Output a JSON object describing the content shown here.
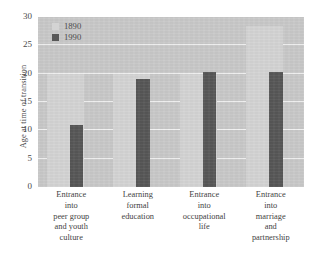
{
  "chart_data": {
    "type": "bar",
    "title": "",
    "subtitle": "",
    "xlabel": "",
    "ylabel": "Age at time of transition",
    "ylim": [
      0,
      30
    ],
    "ytick_values": [
      30,
      25,
      20,
      15,
      10,
      5,
      0
    ],
    "ytick_labels": [
      "30",
      "25",
      "20",
      "15",
      "10",
      "5",
      "0"
    ],
    "grid": true,
    "grid_axis": "y",
    "legend_position": "top-left-inside",
    "orientation": "vertical",
    "grouping": "grouped",
    "categories": [
      "Entrance\ninto\npeer group\nand youth\nculture",
      "Learning\nformal\neducation",
      "Entrance\ninto\noccupational\nlife",
      "Entrance\ninto\nmarriage\nand\npartnership"
    ],
    "category_lines": [
      [
        "Entrance",
        "into",
        "peer group",
        "and youth",
        "culture"
      ],
      [
        "Learning",
        "formal",
        "education"
      ],
      [
        "Entrance",
        "into",
        "occupational",
        "life"
      ],
      [
        "Entrance",
        "into",
        "marriage",
        "and",
        "partnership"
      ]
    ],
    "series": [
      {
        "name": "1890",
        "color": "#d4d4d4",
        "values": [
          20.0,
          20.0,
          20.0,
          28.5
        ]
      },
      {
        "name": "1990",
        "color": "#575757",
        "values": [
          11.0,
          19.0,
          20.3,
          20.3
        ]
      }
    ]
  },
  "legend": {
    "entries": [
      {
        "label": "1890",
        "color": "#d4d4d4"
      },
      {
        "label": "1990",
        "color": "#575757"
      }
    ]
  },
  "colors": {
    "plot_background": "#c9c9c9",
    "gridline": "#f2f2f2",
    "text": "#3f3f3f",
    "series_1890": "#d4d4d4",
    "series_1990": "#575757"
  }
}
